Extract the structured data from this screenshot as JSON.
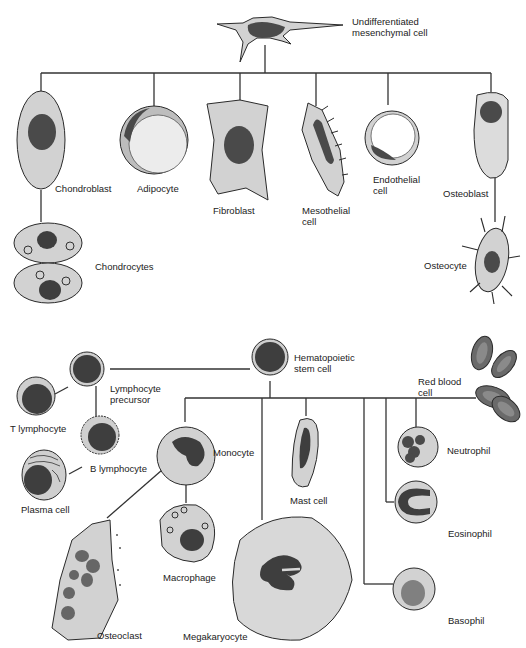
{
  "colors": {
    "cytoplasm": "#d2d2d2",
    "cytoplasm_light": "#e4e4e4",
    "nucleus": "#4a4a4a",
    "outline": "#2a2a2a",
    "line": "#333333"
  },
  "labels": {
    "mesenchymal": "Undifferentiated\nmesenchymal cell",
    "chondroblast": "Chondroblast",
    "adipocyte": "Adipocyte",
    "fibroblast": "Fibroblast",
    "mesothelial": "Mesothelial\ncell",
    "endothelial": "Endothelial\ncell",
    "osteoblast": "Osteoblast",
    "chondrocytes": "Chondrocytes",
    "osteocyte": "Osteocyte",
    "hematopoietic": "Hematopoietic\nstem cell",
    "lymph_precursor": "Lymphocyte\nprecursor",
    "t_lymphocyte": "T lymphocyte",
    "b_lymphocyte": "B lymphocyte",
    "plasma": "Plasma cell",
    "red_blood": "Red blood\ncell",
    "monocyte": "Monocyte",
    "macrophage": "Macrophage",
    "osteoclast": "Osteoclast",
    "mast": "Mast cell",
    "megakaryocyte": "Megakaryocyte",
    "neutrophil": "Neutrophil",
    "eosinophil": "Eosinophil",
    "basophil": "Basophil"
  }
}
